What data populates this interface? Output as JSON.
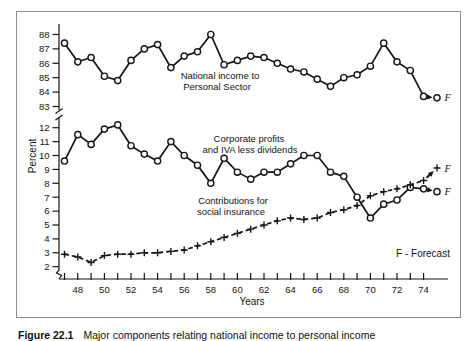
{
  "figure": {
    "caption_label": "Figure 22.1",
    "caption_text": "Major components relating national income to personal income",
    "forecast_note": "F - Forecast",
    "forecast_marker": "F"
  },
  "chart_data": {
    "type": "line",
    "ylabel": "Percent",
    "xlabel": "Years",
    "axis_break": true,
    "top_segment_range": [
      83,
      88
    ],
    "bottom_segment_range": [
      2,
      12
    ],
    "y_ticks_top": [
      88,
      87,
      86,
      85,
      84,
      83
    ],
    "y_ticks_bottom": [
      12,
      11,
      10,
      9,
      8,
      7,
      6,
      5,
      4,
      3,
      2
    ],
    "x_tick_labels": [
      48,
      50,
      52,
      54,
      56,
      58,
      60,
      62,
      64,
      66,
      68,
      70,
      72,
      74
    ],
    "x_tick_start": 47,
    "x_tick_end": 74,
    "years": [
      47,
      48,
      49,
      50,
      51,
      52,
      53,
      54,
      55,
      56,
      57,
      58,
      59,
      60,
      61,
      62,
      63,
      64,
      65,
      66,
      67,
      68,
      69,
      70,
      71,
      72,
      73,
      74
    ],
    "series": [
      {
        "name": "National income to Personal Sector",
        "label_lines": [
          "National income to",
          "Personal Sector"
        ],
        "segment": "top",
        "marker": "circle",
        "linestyle": "solid",
        "values": [
          87.4,
          86.1,
          86.4,
          85.1,
          84.8,
          86.2,
          87.0,
          87.3,
          85.7,
          86.5,
          86.8,
          88.0,
          85.9,
          86.2,
          86.5,
          86.4,
          86.0,
          85.6,
          85.4,
          84.9,
          84.4,
          85.0,
          85.2,
          85.8,
          87.4,
          86.1,
          85.5,
          83.7
        ],
        "forecast": 83.6
      },
      {
        "name": "Corporate profits and IVA less dividends",
        "label_lines": [
          "Corporate profits",
          "and IVA less dividends"
        ],
        "segment": "bottom",
        "marker": "circle",
        "linestyle": "solid",
        "values": [
          9.6,
          11.5,
          10.8,
          11.9,
          12.2,
          10.7,
          10.1,
          9.6,
          11.0,
          10.0,
          9.3,
          8.0,
          9.8,
          8.8,
          8.3,
          8.8,
          8.8,
          9.4,
          10.0,
          10.0,
          8.8,
          8.5,
          7.0,
          5.5,
          6.5,
          6.8,
          7.7,
          7.6
        ],
        "forecast": 7.4
      },
      {
        "name": "Contributions for social insurance",
        "label_lines": [
          "Contributions for",
          "social insurance"
        ],
        "segment": "bottom",
        "marker": "plus",
        "linestyle": "dashed",
        "values": [
          2.9,
          2.7,
          2.3,
          2.8,
          2.9,
          2.9,
          3.0,
          3.0,
          3.1,
          3.2,
          3.5,
          3.8,
          4.1,
          4.4,
          4.7,
          5.0,
          5.3,
          5.5,
          5.4,
          5.5,
          5.9,
          6.1,
          6.4,
          7.1,
          7.4,
          7.6,
          7.9,
          8.2
        ],
        "forecast": 9.1
      }
    ],
    "ink_color": "#161616",
    "background_color": "#ffffff"
  }
}
